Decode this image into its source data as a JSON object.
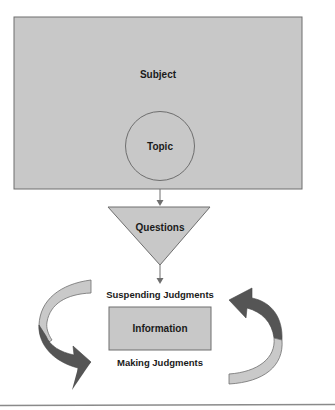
{
  "diagram": {
    "subject": {
      "label": "Subject"
    },
    "topic": {
      "label": "Topic"
    },
    "questions": {
      "label": "Questions"
    },
    "suspending": {
      "label": "Suspending Judgments"
    },
    "information": {
      "label": "Information"
    },
    "making": {
      "label": "Making Judgments"
    }
  },
  "colors": {
    "box_fill": "#c8c8c8",
    "box_stroke": "#6e6e6e",
    "arrow_dark": "#555555",
    "arrow_light": "#c9c9c9",
    "rule": "#8a8a8a"
  }
}
